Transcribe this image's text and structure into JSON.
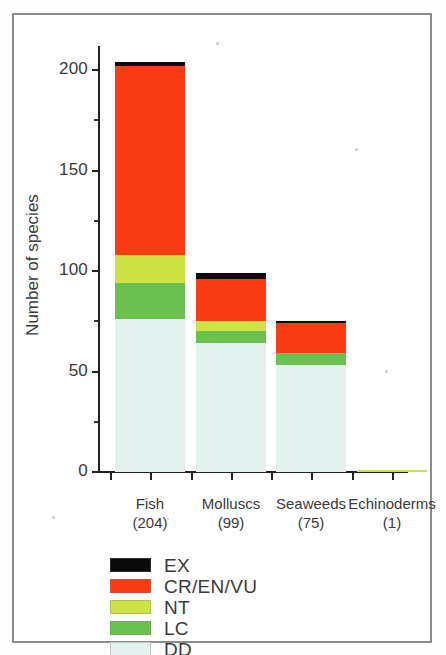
{
  "chart_data": {
    "type": "bar",
    "stacked": true,
    "title": "",
    "xlabel": "",
    "ylabel": "Number of species",
    "ylim": [
      0,
      215
    ],
    "yticks": [
      0,
      50,
      100,
      150,
      200
    ],
    "ytick_labels": [
      "0",
      "50",
      "100",
      "150",
      "200"
    ],
    "yminor_ticks": [
      25,
      75,
      125,
      175
    ],
    "grid": false,
    "legend_position": "below-axes-left",
    "categories": [
      "Fish",
      "Molluscs",
      "Seaweeds",
      "Echinoderms"
    ],
    "category_totals": [
      204,
      99,
      75,
      1
    ],
    "category_labels": [
      "Fish\n(204)",
      "Molluscs\n(99)",
      "Seaweeds\n(75)",
      "Echinoderms\n(1)"
    ],
    "series": [
      {
        "name": "EX",
        "color": "#0a0a0a",
        "values": [
          2,
          3,
          1,
          0
        ]
      },
      {
        "name": "CR/EN/VU",
        "color": "#f93c12",
        "values": [
          94,
          21,
          15,
          0
        ]
      },
      {
        "name": "NT",
        "color": "#cde345",
        "values": [
          14,
          5,
          0,
          1
        ]
      },
      {
        "name": "LC",
        "color": "#6cc04f",
        "values": [
          18,
          6,
          6,
          0
        ]
      },
      {
        "name": "DD",
        "color": "#e3f1ef",
        "values": [
          76,
          64,
          53,
          0
        ]
      }
    ],
    "legend_entries": [
      {
        "label": "EX",
        "color": "#0a0a0a"
      },
      {
        "label": "CR/EN/VU",
        "color": "#f93c12"
      },
      {
        "label": "NT",
        "color": "#cde345"
      },
      {
        "label": "LC",
        "color": "#6cc04f"
      },
      {
        "label": "DD",
        "color": "#e3f1ef"
      }
    ]
  },
  "axis": {
    "y_title": "Number of species",
    "y_labels": [
      "200",
      "150",
      "100",
      "50",
      "0"
    ]
  },
  "categories": [
    {
      "name": "Fish",
      "count": "(204)"
    },
    {
      "name": "Molluscs",
      "count": "(99)"
    },
    {
      "name": "Seaweeds",
      "count": "(75)"
    },
    {
      "name": "Echinoderms",
      "count": "(1)"
    }
  ],
  "legend": [
    {
      "label": "EX"
    },
    {
      "label": "CR/EN/VU"
    },
    {
      "label": "NT"
    },
    {
      "label": "LC"
    },
    {
      "label": "DD"
    }
  ]
}
